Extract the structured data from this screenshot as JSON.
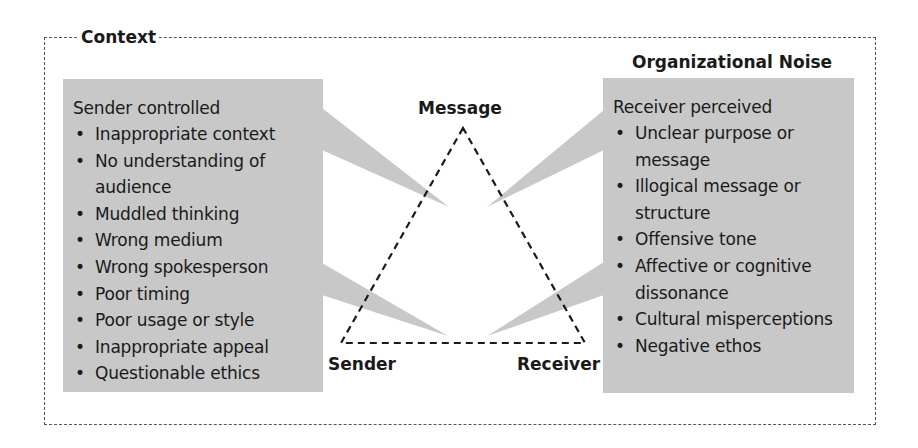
{
  "context_label": "Context",
  "noise_label": "Organizational Noise",
  "triangle": {
    "top": "Message",
    "bottom_left": "Sender",
    "bottom_right": "Receiver"
  },
  "sender_box": {
    "title": "Sender controlled",
    "bullet": "•",
    "items": [
      "Inappropriate context",
      "No understanding of audience",
      "Muddled thinking",
      "Wrong medium",
      "Wrong spokesperson",
      "Poor timing",
      "Poor usage or style",
      "Inappropriate appeal",
      "Questionable ethics"
    ]
  },
  "receiver_box": {
    "title": "Receiver perceived",
    "bullet": "•",
    "items": [
      "Unclear purpose or message",
      "Illogical message or structure",
      "Offensive tone",
      "Affective or cognitive dissonance",
      "Cultural misperceptions",
      "Negative ethos"
    ]
  },
  "colors": {
    "box_fill": "#c8c8c8",
    "line": "#1a1a1a",
    "border": "#555555"
  }
}
